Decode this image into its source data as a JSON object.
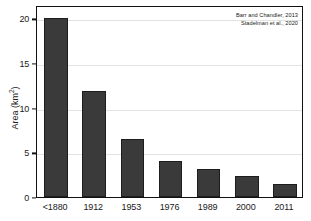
{
  "chart_data": {
    "type": "bar",
    "title": "",
    "xlabel": "",
    "ylabel": "Area (km²)",
    "ylabel_base": "Area (km",
    "ylabel_sup": "2",
    "ylabel_tail": ")",
    "categories": [
      "<1880",
      "1912",
      "1953",
      "1976",
      "1989",
      "2000",
      "2011"
    ],
    "values": [
      20.0,
      11.9,
      6.5,
      4.0,
      3.1,
      2.4,
      1.5
    ],
    "ylim": [
      0,
      21.5
    ],
    "yticks": [
      0,
      5,
      10,
      15,
      20
    ],
    "ytick_labels": [
      "0",
      "5",
      "10",
      "15",
      "20"
    ],
    "grid": true,
    "grid_axis": "y",
    "legend": "none",
    "bar_color": "#3a3a3a",
    "bar_edge_color": "#1d1d1d",
    "grid_color": "#e2e2e2",
    "axis_color": "#111111",
    "background_color": "#ffffff"
  },
  "annotations": {
    "source_lines": [
      "Barr and Chandler, 2013",
      "Stadelman et al., 2020"
    ]
  }
}
